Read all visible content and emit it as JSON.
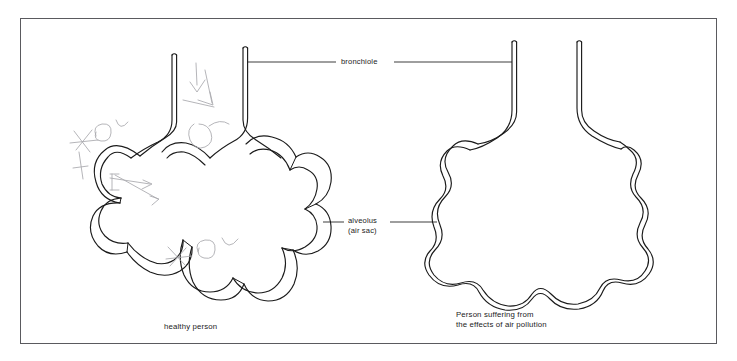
{
  "figure": {
    "background_color": "#ffffff",
    "frame_color": "#5a5a5e",
    "line_color": "#1b1b1b"
  },
  "labels": {
    "bronchiole": "bronchiole",
    "alveolus": "alveolus",
    "alveolus_sub": "(air sac)"
  },
  "captions": {
    "healthy": "healthy person",
    "polluted_line1": "Person suffering from",
    "polluted_line2": "the effects of air pollution"
  },
  "diagram_data": {
    "type": "labelled-biology-diagram",
    "panels": [
      {
        "name": "healthy-lung",
        "caption": "healthy person",
        "description": "Cluster of many separate rounded alveoli (air sacs) attached to two bronchiole tubes; individual sacs clearly divided by walls",
        "alveoli_count": 9,
        "bronchiole_tubes": 2,
        "walls_intact": true
      },
      {
        "name": "polluted-lung",
        "caption": "Person suffering from the effects of air pollution",
        "description": "Alveolar walls broken down so the sacs have merged into one large scalloped air space with reduced surface area",
        "alveoli_count": 1,
        "bronchiole_tubes": 2,
        "walls_intact": false
      }
    ],
    "annotations": [
      {
        "text": "bronchiole",
        "points_to": [
          "healthy-lung",
          "polluted-lung"
        ]
      },
      {
        "text": "alveolus (air sac)",
        "points_to": [
          "healthy-lung",
          "polluted-lung"
        ]
      }
    ],
    "pencil_marks": {
      "present": true,
      "description": "Faint handwritten pencil annotations resembling O2 with arrows near the left alveoli of the healthy lung and near its bronchiole"
    }
  }
}
